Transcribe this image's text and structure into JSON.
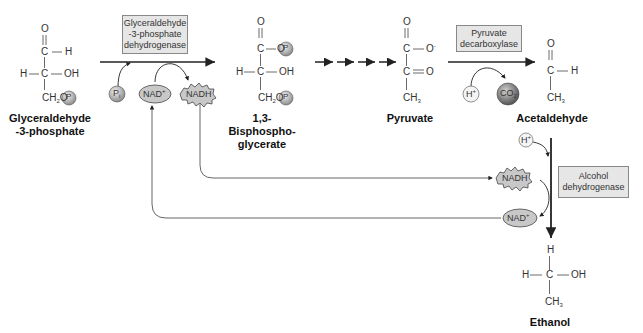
{
  "enzymes": {
    "gapdh": [
      "Glyceraldehyde",
      "-3-phosphate",
      "dehydrogenase"
    ],
    "pdc": [
      "Pyruvate",
      "decarboxylase"
    ],
    "adh": [
      "Alcohol",
      "dehydrogenase"
    ]
  },
  "compounds": {
    "g3p": [
      "Glyceraldehyde",
      "-3-phosphate"
    ],
    "bpg": [
      "1,3-Bisphospho-",
      "glycerate"
    ],
    "pyruvate": "Pyruvate",
    "acetaldehyde": "Acetaldehyde",
    "ethanol": "Ethanol"
  },
  "cofactors": {
    "pi": "P",
    "pi_sub": "i",
    "nad": "NAD",
    "nad_sup": "+",
    "nadh": "NADH",
    "h_plus": "H",
    "h_sup": "+",
    "co2": "CO",
    "co2_sub": "2",
    "phosphate": "P"
  },
  "atoms": {
    "O": "O",
    "C": "C",
    "H": "H",
    "OH": "OH",
    "CH2O": "CH",
    "CH2O_sub": "2",
    "CH2O_end": "O",
    "CH3": "CH",
    "CH3_sub": "3",
    "Ominus": "O",
    "minus": "-"
  },
  "colors": {
    "line": "#222222",
    "thin_line": "#555555",
    "enzyme_box": "#e6e6e6",
    "cofactor_fill": "#c8c8c8",
    "co2_fill": "#9a9a9a"
  }
}
